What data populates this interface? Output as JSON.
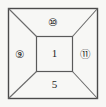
{
  "figure": {
    "type": "technical-line-diagram",
    "background_color": "#f7f7f5",
    "line_color": "#4a4a4a",
    "inner_line_color": "#5a5a5a",
    "text_color": "#1d1d1d",
    "outer_square": {
      "x": 8,
      "y": 8,
      "width": 90,
      "height": 91
    },
    "inner_square": {
      "x": 36,
      "y": 36,
      "width": 37,
      "height": 36
    },
    "diagonals": [
      {
        "name": "top-left-diagonal",
        "from": [
          8,
          8
        ],
        "to": [
          36,
          36
        ]
      },
      {
        "name": "top-right-diagonal",
        "from": [
          98,
          8
        ],
        "to": [
          73,
          36
        ]
      },
      {
        "name": "bottom-left-diagonal",
        "from": [
          8,
          99
        ],
        "to": [
          36,
          72
        ]
      },
      {
        "name": "bottom-right-diagonal",
        "from": [
          98,
          99
        ],
        "to": [
          73,
          72
        ]
      }
    ]
  },
  "labels": {
    "top": "⑩",
    "left": "⑨",
    "right": "⑪",
    "center": "1",
    "bottom": "5"
  },
  "label_meta": {
    "top_value": "10",
    "top_style": "circled",
    "left_value": "9",
    "left_style": "circled",
    "right_value": "11",
    "right_style": "circled",
    "center_value": "1",
    "center_style": "plain",
    "bottom_value": "5",
    "bottom_style": "plain"
  }
}
